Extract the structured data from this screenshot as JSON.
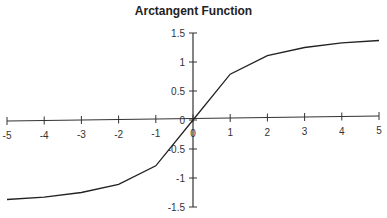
{
  "chart_data": {
    "type": "line",
    "title": "Arctangent Function",
    "xlabel": "",
    "ylabel": "",
    "xlim": [
      -5,
      5
    ],
    "ylim": [
      -1.5,
      1.5
    ],
    "x_ticks": [
      "-5",
      "-4",
      "-3",
      "-2",
      "-1",
      "0",
      "1",
      "2",
      "3",
      "4",
      "5"
    ],
    "y_ticks": [
      "1.5",
      "1",
      "0.5",
      "0",
      "-0.5",
      "-1",
      "-1.5"
    ],
    "grid": false,
    "legend": null,
    "series": [
      {
        "name": "arctan(x)",
        "x": [
          -5,
          -4,
          -3,
          -2,
          -1,
          0,
          1,
          2,
          3,
          4,
          5
        ],
        "y": [
          -1.37,
          -1.33,
          -1.25,
          -1.11,
          -0.79,
          0,
          0.79,
          1.11,
          1.25,
          1.33,
          1.37
        ]
      }
    ]
  }
}
